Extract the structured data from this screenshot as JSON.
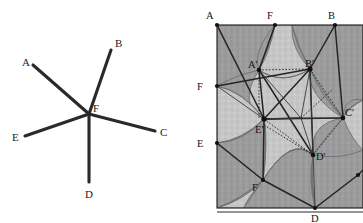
{
  "figure": {
    "title": "",
    "background_color": "#ffffff",
    "panels": [
      {
        "id": "left",
        "name": "five-spoke-star-vertex-diagram",
        "description": "Five line segments radiating from a common point F",
        "center_label": "F",
        "center": {
          "x": 89,
          "y": 114
        },
        "spokes": [
          {
            "label": "A",
            "end_x": 33,
            "end_y": 65,
            "label_x": 28,
            "label_y": 62
          },
          {
            "label": "B",
            "end_x": 111,
            "end_y": 50,
            "label_x": 116,
            "label_y": 47
          },
          {
            "label": "C",
            "end_x": 155,
            "end_y": 131,
            "label_x": 160,
            "label_y": 135
          },
          {
            "label": "D",
            "end_x": 89,
            "end_y": 182,
            "label_x": 86,
            "label_y": 196
          },
          {
            "label": "E",
            "end_x": 25,
            "end_y": 136,
            "label_x": 13,
            "label_y": 140
          }
        ],
        "center_label_x": 93,
        "center_label_y": 111,
        "stroke_color": "#2a2a2a",
        "label_color": "#1c1c1c"
      },
      {
        "id": "right",
        "name": "tiling-square-with-curved-star",
        "description": "Shaded square tile with curved-sided star rosette, boundary labels and primed interior labels",
        "square": {
          "left": 35,
          "top": 25,
          "right": 181,
          "bottom": 208
        },
        "fill_dark": "#9b9b9b",
        "fill_light": "#c6c6c6",
        "edge_labels": [
          {
            "label": "A",
            "x": 29,
            "y": 22,
            "px": 35,
            "py": 25
          },
          {
            "label": "F",
            "x": 89,
            "y": 22,
            "px": 93,
            "py": 25
          },
          {
            "label": "B",
            "x": 148,
            "y": 22,
            "px": 153,
            "py": 25
          },
          {
            "label": "F",
            "x": 22,
            "y": 90,
            "px": 35,
            "py": 86
          },
          {
            "label": "E",
            "x": 22,
            "y": 147,
            "px": 35,
            "py": 143
          },
          {
            "label": "F",
            "x": 76,
            "y": 188,
            "px": 81,
            "py": 180
          },
          {
            "label": "D",
            "x": 130,
            "y": 221,
            "px": 133,
            "py": 208
          }
        ],
        "interior_labels": [
          {
            "label": "A'",
            "x": 70,
            "y": 68,
            "px": 77,
            "py": 70
          },
          {
            "label": "B'",
            "x": 125,
            "y": 67,
            "px": 128,
            "py": 69
          },
          {
            "label": "E'",
            "x": 76,
            "y": 132,
            "px": 82,
            "py": 119
          },
          {
            "label": "C'",
            "x": 163,
            "y": 116,
            "px": 161,
            "py": 118
          },
          {
            "label": "D'",
            "x": 135,
            "y": 160,
            "px": 131,
            "py": 155
          }
        ],
        "center_point": {
          "x": 119,
          "y": 118
        },
        "stroke_color": "#242424",
        "arc_color": "#6f6f6f"
      }
    ]
  },
  "labels": {
    "A": "A",
    "B": "B",
    "C": "C",
    "D": "D",
    "E": "E",
    "F": "F",
    "A_prime": "A'",
    "B_prime": "B'",
    "C_prime": "C'",
    "D_prime": "D'",
    "E_prime": "E'"
  }
}
